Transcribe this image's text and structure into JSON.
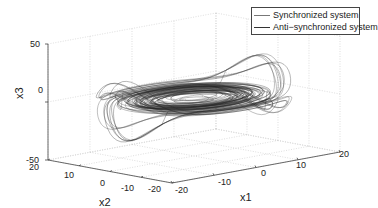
{
  "chart_data": {
    "type": "line3d",
    "title": "",
    "xlabel": "x1",
    "ylabel": "x2",
    "zlabel": "x3",
    "xlim": [
      -20,
      20
    ],
    "ylim": [
      -20,
      20
    ],
    "zlim": [
      -50,
      50
    ],
    "x_ticks": [
      -20,
      -10,
      0,
      10,
      20
    ],
    "y_ticks": [
      20,
      10,
      0,
      -10,
      -20
    ],
    "z_ticks": [
      50,
      0,
      -50
    ],
    "x_tick_labels": [
      "-20",
      "-10",
      "0",
      "10",
      "20"
    ],
    "y_tick_labels": [
      "20",
      "10",
      "0",
      "-10",
      "-20"
    ],
    "z_tick_labels": [
      "50",
      "0",
      "-50"
    ],
    "grid": true,
    "legend_position": "upper right",
    "series": [
      {
        "name": "Synchronized system",
        "color": "#555555",
        "description": "chaotic spiral trajectory in x1-x2 plane near x3=0 with excursions to about ±40 in x3"
      },
      {
        "name": "Anti-synchronized system",
        "color": "#333333",
        "description": "mirrored chaotic spiral trajectory overlapping the synchronized system"
      }
    ]
  },
  "legend": {
    "items": [
      {
        "label": "Synchronized system"
      },
      {
        "label": "Anti−synchronized system"
      }
    ]
  },
  "axes": {
    "x1_label": "x1",
    "x2_label": "x2",
    "x3_label": "x3",
    "x1_ticks": [
      "-20",
      "-10",
      "0",
      "10",
      "20"
    ],
    "x2_ticks": [
      "20",
      "10",
      "0",
      "-10",
      "-20"
    ],
    "x3_ticks": [
      "50",
      "0",
      "-50"
    ]
  }
}
